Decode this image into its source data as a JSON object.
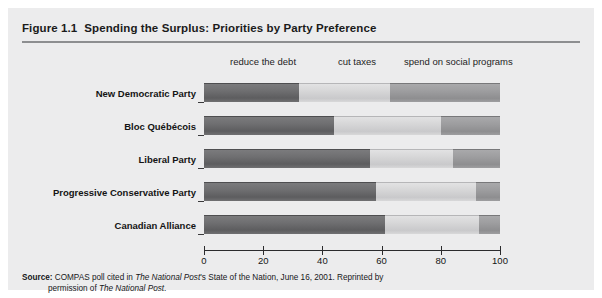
{
  "figure": {
    "number": "Figure 1.1",
    "title": "Spending the Surplus: Priorities by Party Preference"
  },
  "source": {
    "label": "Source:",
    "text_part1": " COMPAS poll cited in ",
    "italic1": "The National Post",
    "text_part2": "'s State of the Nation, June 16, 2001. Reprinted by",
    "line2_part1": "permission of ",
    "italic2": "The National Post",
    "line2_part2": "."
  },
  "chart_data": {
    "type": "bar",
    "orientation": "horizontal",
    "stacked": true,
    "title": "Spending the Surplus: Priorities by Party Preference",
    "xlabel": "",
    "ylabel": "",
    "xlim": [
      0,
      100
    ],
    "xticks": [
      0,
      20,
      40,
      60,
      80,
      100
    ],
    "xtick_labels": [
      "0",
      "20",
      "40",
      "60",
      "80",
      "100"
    ],
    "grid": false,
    "legend_position": "top",
    "categories": [
      "New Democratic Party",
      "Bloc Québécois",
      "Liberal Party",
      "Progressive Conservative Party",
      "Canadian Alliance"
    ],
    "series": [
      {
        "name": "reduce the debt",
        "color": "#6a6a6c",
        "values": [
          32,
          44,
          56,
          58,
          61
        ]
      },
      {
        "name": "cut taxes",
        "color": "#d4d4d6",
        "values": [
          31,
          36,
          28,
          34,
          32
        ]
      },
      {
        "name": "spend on social programs",
        "color": "#9a9a9c",
        "values": [
          37,
          20,
          16,
          8,
          7
        ]
      }
    ],
    "series_header_labels": [
      {
        "text": "reduce the debt",
        "x_px": 222
      },
      {
        "text": "cut taxes",
        "x_px": 330
      },
      {
        "text": "spend on social programs",
        "x_px": 396
      }
    ]
  }
}
